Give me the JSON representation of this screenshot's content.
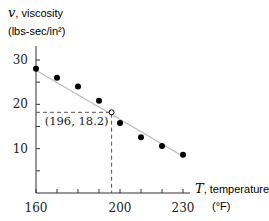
{
  "chart_data": {
    "type": "scatter",
    "title": "",
    "xlabel": "T, temperature",
    "xlabel_var": "T",
    "xlabel_text": ", temperature",
    "xunit": "(°F)",
    "ylabel": "v, viscosity",
    "ylabel_var": "v",
    "ylabel_text": ", viscosity",
    "yunit": "(lbs-sec/in²)",
    "xlim": [
      160,
      230
    ],
    "ylim": [
      0,
      30
    ],
    "x_tick_labels": [
      "160",
      "200",
      "230"
    ],
    "x_ticks": [
      160,
      170,
      180,
      190,
      200,
      210,
      220,
      230
    ],
    "y_tick_labels": [
      "10",
      "20",
      "30"
    ],
    "y_ticks": [
      5,
      10,
      15,
      20,
      25,
      30
    ],
    "grid": false,
    "legend": null,
    "series": [
      {
        "name": "measured viscosity",
        "marker": "filled-circle",
        "x": [
          160,
          170,
          180,
          190,
          200,
          210,
          220,
          230
        ],
        "y": [
          28.0,
          26.0,
          24.0,
          20.8,
          15.8,
          12.6,
          10.6,
          8.6
        ]
      },
      {
        "name": "linear fit",
        "style": "line",
        "x": [
          160,
          230
        ],
        "y": [
          27.7,
          8.3
        ]
      }
    ],
    "annotations": [
      {
        "type": "open-circle-point",
        "x": 196,
        "y": 18.2,
        "label": "(196, 18.2)",
        "dashed_guides": true
      }
    ]
  },
  "colors": {
    "axis": "#333333",
    "fit_line": "#bbbbbb",
    "points": "#000000",
    "dashed": "#555555"
  }
}
